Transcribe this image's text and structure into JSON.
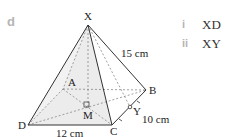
{
  "part": "d",
  "figure": {
    "type": "square-based pyramid",
    "vertices": {
      "apex": "X",
      "base": [
        "A",
        "B",
        "C",
        "D"
      ],
      "center": "M",
      "midpoint": "Y"
    },
    "labels": {
      "X": "X",
      "A": "A",
      "B": "B",
      "C": "C",
      "D": "D",
      "M": "M",
      "Y": "Y"
    },
    "measurements": {
      "slant_edge_XB": "15 cm",
      "base_DC": "12 cm",
      "base_CB": "10 cm"
    }
  },
  "questions": [
    {
      "number": "i",
      "text": "XD"
    },
    {
      "number": "ii",
      "text": "XY"
    }
  ],
  "colors": {
    "face_fill": "#ececec",
    "line": "#333333",
    "dashed": "#888888",
    "part_label": "#b5b5b5"
  }
}
